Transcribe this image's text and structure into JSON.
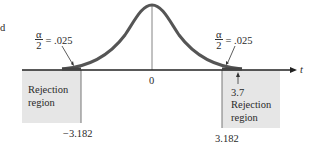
{
  "figure": {
    "fragment_text": "d",
    "left_tail": {
      "alpha_label_num": "α",
      "alpha_label_den": "2",
      "alpha_value": "= .025",
      "region_label_line1": "Rejection",
      "region_label_line2": "region",
      "critical_value": "−3.182"
    },
    "right_tail": {
      "alpha_label_num": "α",
      "alpha_label_den": "2",
      "alpha_value": "= .025",
      "test_statistic": "3.7",
      "region_label_line1": "Rejection",
      "region_label_line2": "region",
      "critical_value": "3.182"
    },
    "center_label": "0",
    "axis_label": "t",
    "colors": {
      "curve": "#555555",
      "region_fill": "#e6e6e6",
      "axis": "#222222"
    }
  }
}
